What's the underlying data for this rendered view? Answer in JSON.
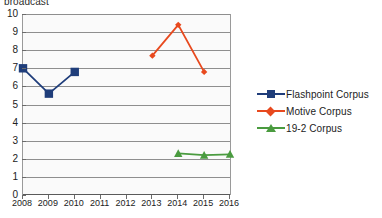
{
  "chart_data": {
    "type": "line",
    "title": "broadcast",
    "xlabel": "",
    "ylabel": "",
    "x": [
      2008,
      2009,
      2010,
      2011,
      2012,
      2013,
      2014,
      2015,
      2016
    ],
    "xticklabels": [
      "2008",
      "2009",
      "2010",
      "2011",
      "2012",
      "2013",
      "2014",
      "2015",
      "2016"
    ],
    "yticklabels": [
      "0",
      "1",
      "2",
      "3",
      "4",
      "5",
      "6",
      "7",
      "8",
      "9",
      "10"
    ],
    "ylim": [
      0,
      10
    ],
    "ytick_step": 1,
    "grid": "horizontal",
    "legend_position": "right",
    "series": [
      {
        "name": "Flashpoint Corpus",
        "color": "#1f3d7a",
        "marker": "square",
        "points": [
          {
            "x": 2008,
            "y": 7.0
          },
          {
            "x": 2009,
            "y": 5.6
          },
          {
            "x": 2010,
            "y": 6.8
          }
        ]
      },
      {
        "name": "Motive Corpus",
        "color": "#e8491e",
        "marker": "diamond",
        "points": [
          {
            "x": 2013,
            "y": 7.7
          },
          {
            "x": 2014,
            "y": 9.4
          },
          {
            "x": 2015,
            "y": 6.8
          }
        ]
      },
      {
        "name": "19-2 Corpus",
        "color": "#4a9b3f",
        "marker": "triangle",
        "points": [
          {
            "x": 2014,
            "y": 2.3
          },
          {
            "x": 2015,
            "y": 2.2
          },
          {
            "x": 2016,
            "y": 2.25
          }
        ]
      }
    ]
  },
  "legend": {
    "items": [
      {
        "label": "Flashpoint Corpus"
      },
      {
        "label": "Motive Corpus"
      },
      {
        "label": "19-2 Corpus"
      }
    ]
  }
}
